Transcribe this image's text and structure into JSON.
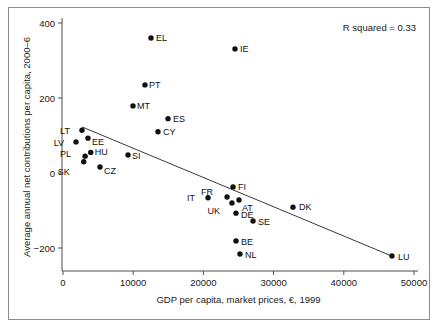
{
  "chart_data": {
    "type": "scatter",
    "title": "",
    "xlabel": "GDP per capita, market prices, €, 1999",
    "ylabel": "Average annual net contributions per capita, 2000–6",
    "xlim": [
      0,
      50000
    ],
    "ylim": [
      -260,
      420
    ],
    "xticks": [
      0,
      10000,
      20000,
      30000,
      40000,
      50000
    ],
    "xtick_labels": [
      "0",
      "10000",
      "20000",
      "30000",
      "40000",
      "50000"
    ],
    "yticks": [
      -200,
      0,
      200,
      400
    ],
    "ytick_labels": [
      "−200",
      "0",
      "200",
      "400"
    ],
    "grid": false,
    "legend": null,
    "annotation": "R squared = 0.33",
    "r_squared": 0.33,
    "trendline": {
      "type": "linear",
      "x_start": 2700,
      "y_start": 123,
      "x_end": 46900,
      "y_end": -222
    },
    "point_color": "#111111",
    "line_color": "#3a3a3a",
    "points": [
      {
        "label": "LV",
        "x": 1850,
        "y": 83,
        "lx": -12,
        "ly": 4
      },
      {
        "label": "LT",
        "x": 2700,
        "y": 114,
        "lx": -12,
        "ly": 4
      },
      {
        "label": "SK",
        "x": 2950,
        "y": 30,
        "lx": -14,
        "ly": 13
      },
      {
        "label": "PL",
        "x": 3150,
        "y": 45,
        "lx": -14,
        "ly": 1
      },
      {
        "label": "EE",
        "x": 3560,
        "y": 93,
        "lx": 4,
        "ly": 7
      },
      {
        "label": "HU",
        "x": 3950,
        "y": 55,
        "lx": 4,
        "ly": 3
      },
      {
        "label": "CZ",
        "x": 5270,
        "y": 16,
        "lx": 4,
        "ly": 7
      },
      {
        "label": "SI",
        "x": 9260,
        "y": 48,
        "lx": 4,
        "ly": 4
      },
      {
        "label": "MT",
        "x": 9970,
        "y": 179,
        "lx": 4,
        "ly": 3
      },
      {
        "label": "PT",
        "x": 11680,
        "y": 235,
        "lx": 4,
        "ly": 3
      },
      {
        "label": "EL",
        "x": 12540,
        "y": 360,
        "lx": 5,
        "ly": 3
      },
      {
        "label": "CY",
        "x": 13530,
        "y": 110,
        "lx": 5,
        "ly": 3
      },
      {
        "label": "ES",
        "x": 14960,
        "y": 145,
        "lx": 5,
        "ly": 3
      },
      {
        "label": "IT",
        "x": 20660,
        "y": -66,
        "lx": -13,
        "ly": 3
      },
      {
        "label": "FR",
        "x": 23370,
        "y": -64,
        "lx": -14,
        "ly": -2
      },
      {
        "label": "UK",
        "x": 24070,
        "y": -80,
        "lx": -12,
        "ly": 11
      },
      {
        "label": "FI",
        "x": 24220,
        "y": -37,
        "lx": 5,
        "ly": 3
      },
      {
        "label": "IE",
        "x": 24500,
        "y": 331,
        "lx": 5,
        "ly": 3
      },
      {
        "label": "DE",
        "x": 24640,
        "y": -107,
        "lx": 5,
        "ly": 5
      },
      {
        "label": "BE",
        "x": 24640,
        "y": -181,
        "lx": 5,
        "ly": 4
      },
      {
        "label": "AT",
        "x": 25070,
        "y": -72,
        "lx": 3,
        "ly": 11
      },
      {
        "label": "NL",
        "x": 25210,
        "y": -216,
        "lx": 5,
        "ly": 4
      },
      {
        "label": "SE",
        "x": 27070,
        "y": -128,
        "lx": 5,
        "ly": 4
      },
      {
        "label": "DK",
        "x": 32760,
        "y": -91,
        "lx": 6,
        "ly": 3
      },
      {
        "label": "LU",
        "x": 46860,
        "y": -221,
        "lx": 6,
        "ly": 4
      }
    ]
  },
  "figure": {
    "background_color": "#ffffff",
    "frame_color": "#8c8c8c"
  }
}
